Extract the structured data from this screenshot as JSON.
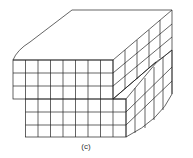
{
  "figure": {
    "caption": "(c)",
    "line_color": "#222222",
    "grid": {
      "front_columns": 8,
      "upper_rows": 3,
      "lower_rows": 3,
      "side_columns": 5
    }
  }
}
